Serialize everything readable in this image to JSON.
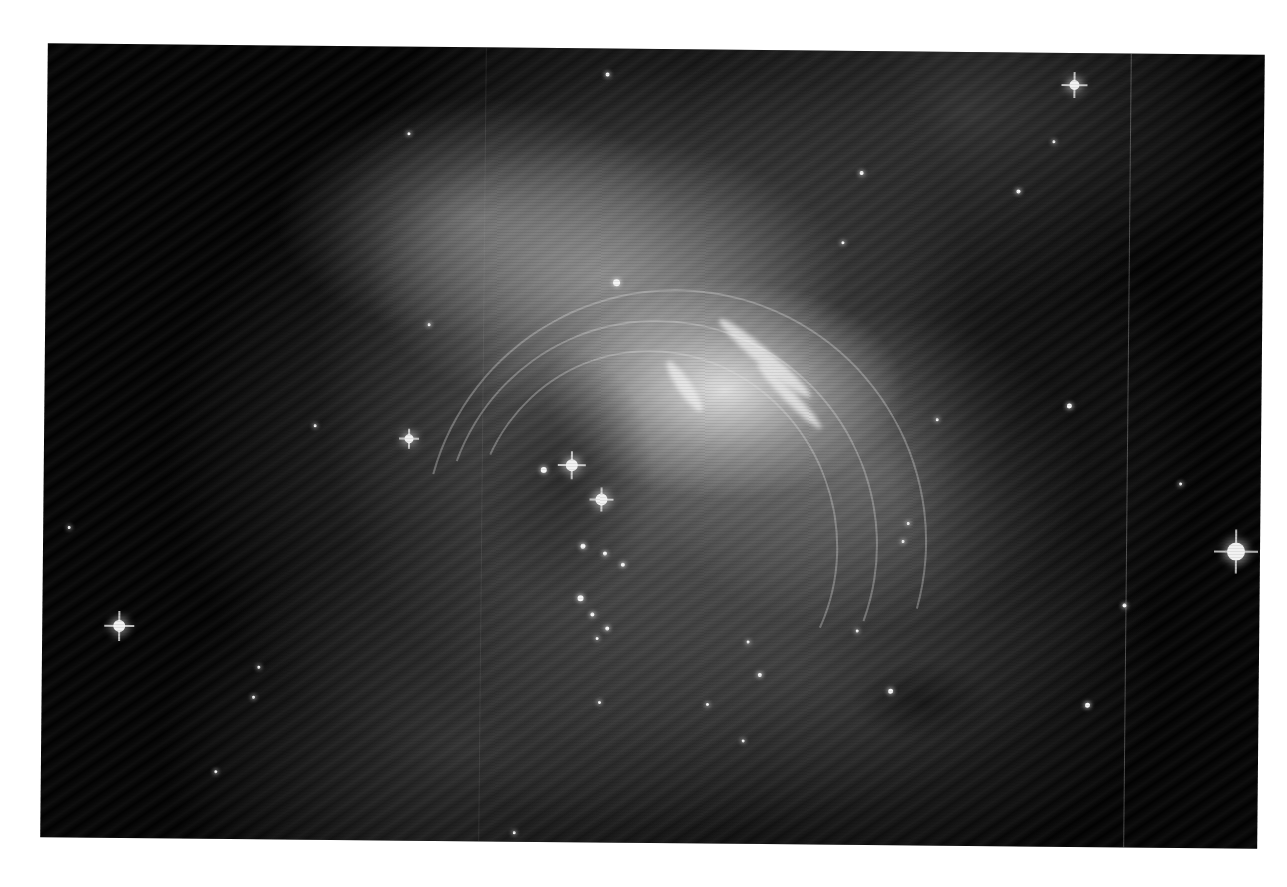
{
  "image": {
    "subject": "grayscale nebula photograph with filamentary structure and stars",
    "background_color": "#ffffff",
    "frame_color": "#020202"
  },
  "streaks": [
    {
      "x": 610,
      "y": 330,
      "w": 60,
      "h": 14,
      "angle": 55
    },
    {
      "x": 660,
      "y": 300,
      "w": 120,
      "h": 16,
      "angle": 40
    },
    {
      "x": 700,
      "y": 340,
      "w": 90,
      "h": 12,
      "angle": 45
    }
  ],
  "arcs": [
    {
      "x": 430,
      "y": 300,
      "w": 360,
      "h": 380,
      "angle": -20
    },
    {
      "x": 400,
      "y": 270,
      "w": 430,
      "h": 440,
      "angle": -25
    },
    {
      "x": 380,
      "y": 240,
      "w": 500,
      "h": 500,
      "angle": -30
    }
  ],
  "vertical_lines": [
    {
      "x": 1083,
      "color": "rgba(200,200,200,0.35)"
    },
    {
      "x": 438,
      "color": "rgba(160,160,160,0.15)"
    }
  ],
  "big_stars": [
    {
      "x": 1027,
      "y": 32,
      "size": 10,
      "spike": 26
    },
    {
      "x": 1193,
      "y": 497,
      "size": 18,
      "spike": 44
    },
    {
      "x": 77,
      "y": 582,
      "size": 12,
      "spike": 30
    },
    {
      "x": 528,
      "y": 417,
      "size": 12,
      "spike": 28
    },
    {
      "x": 558,
      "y": 451,
      "size": 12,
      "spike": 24
    },
    {
      "x": 365,
      "y": 392,
      "size": 9,
      "spike": 20
    }
  ],
  "stars": [
    {
      "x": 560,
      "y": 26,
      "s": 4
    },
    {
      "x": 362,
      "y": 87,
      "s": 3
    },
    {
      "x": 815,
      "y": 122,
      "s": 4
    },
    {
      "x": 972,
      "y": 139,
      "s": 4
    },
    {
      "x": 1007,
      "y": 89,
      "s": 3
    },
    {
      "x": 797,
      "y": 192,
      "s": 3
    },
    {
      "x": 571,
      "y": 234,
      "s": 7
    },
    {
      "x": 384,
      "y": 278,
      "s": 3
    },
    {
      "x": 271,
      "y": 380,
      "s": 3
    },
    {
      "x": 1025,
      "y": 353,
      "s": 5
    },
    {
      "x": 26,
      "y": 484,
      "s": 3
    },
    {
      "x": 500,
      "y": 422,
      "s": 6
    },
    {
      "x": 540,
      "y": 498,
      "s": 5
    },
    {
      "x": 580,
      "y": 516,
      "s": 4
    },
    {
      "x": 562,
      "y": 505,
      "s": 4
    },
    {
      "x": 538,
      "y": 550,
      "s": 6
    },
    {
      "x": 550,
      "y": 566,
      "s": 4
    },
    {
      "x": 565,
      "y": 580,
      "s": 4
    },
    {
      "x": 865,
      "y": 472,
      "s": 3
    },
    {
      "x": 860,
      "y": 490,
      "s": 3
    },
    {
      "x": 1082,
      "y": 552,
      "s": 4
    },
    {
      "x": 1046,
      "y": 652,
      "s": 5
    },
    {
      "x": 849,
      "y": 640,
      "s": 5
    },
    {
      "x": 718,
      "y": 625,
      "s": 4
    },
    {
      "x": 706,
      "y": 592,
      "s": 3
    },
    {
      "x": 815,
      "y": 580,
      "s": 3
    },
    {
      "x": 702,
      "y": 691,
      "s": 3
    },
    {
      "x": 217,
      "y": 622,
      "s": 3
    },
    {
      "x": 212,
      "y": 652,
      "s": 3
    },
    {
      "x": 175,
      "y": 727,
      "s": 3
    },
    {
      "x": 558,
      "y": 654,
      "s": 3
    },
    {
      "x": 666,
      "y": 655,
      "s": 3
    },
    {
      "x": 474,
      "y": 785,
      "s": 3
    },
    {
      "x": 1137,
      "y": 430,
      "s": 3
    },
    {
      "x": 893,
      "y": 368,
      "s": 3
    },
    {
      "x": 555,
      "y": 590,
      "s": 3
    }
  ]
}
